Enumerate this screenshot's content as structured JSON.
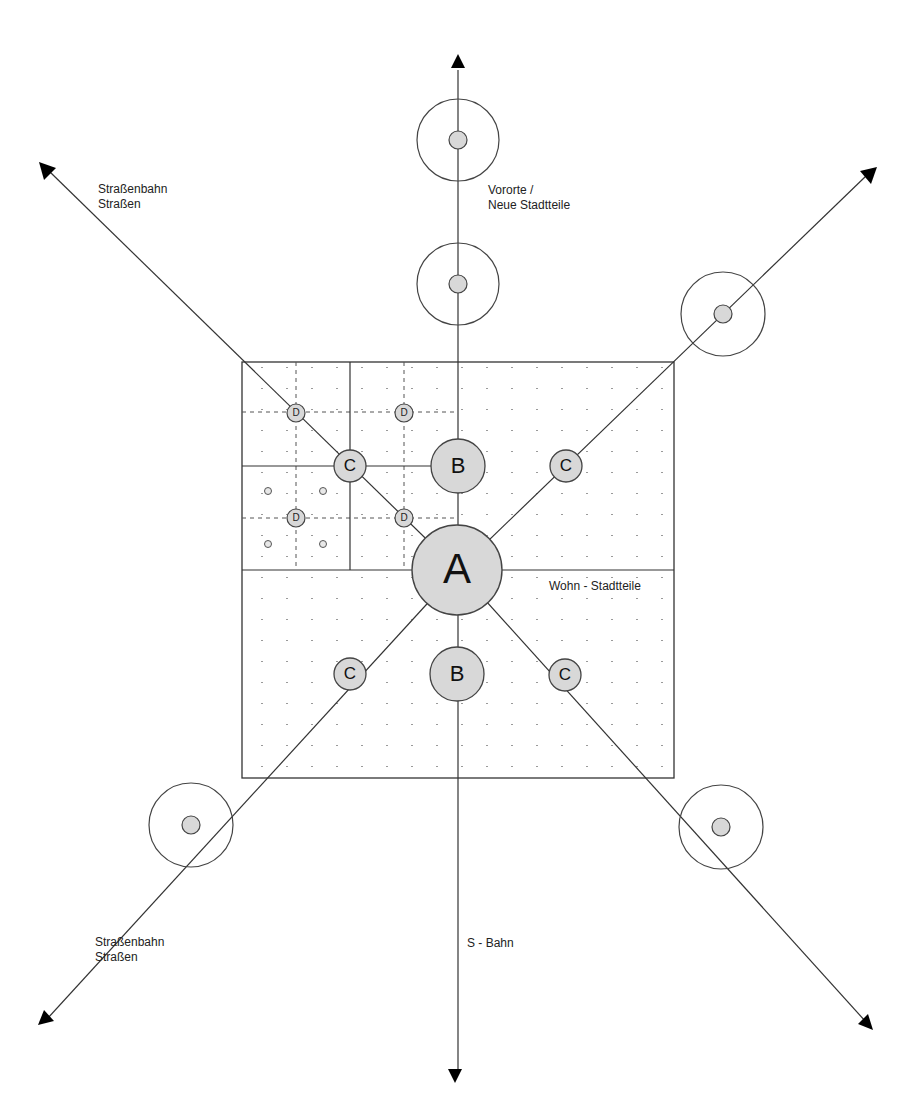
{
  "diagram": {
    "colors": {
      "line": "#333333",
      "node_fill": "#d8d8d8",
      "node_stroke": "#444444",
      "dot": "#999999",
      "arrow": "#000000",
      "background": "#ffffff"
    },
    "labels": {
      "top_left_line1": "Straßenbahn",
      "top_left_line2": "Straßen",
      "top_center_line1": "Vororte /",
      "top_center_line2": "Neue Stadtteile",
      "residential": "Wohn - Stadtteile",
      "bottom_left_line1": "Straßenbahn",
      "bottom_left_line2": "Straßen",
      "bottom_center": "S - Bahn"
    },
    "nodes": {
      "center": "A",
      "b_top": "B",
      "b_bottom": "B",
      "c_top_left": "C",
      "c_top_right": "C",
      "c_bottom_left": "C",
      "c_bottom_right": "C",
      "d1": "D",
      "d2": "D",
      "d3": "D",
      "d4": "D"
    }
  }
}
